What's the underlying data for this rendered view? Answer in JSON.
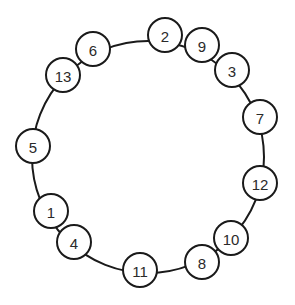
{
  "diagram": {
    "type": "ring-of-numbered-nodes",
    "ring": {
      "cx": 148,
      "cy": 157,
      "r": 116
    },
    "node_radius": 17,
    "nodes": [
      {
        "label": "2",
        "x": 165,
        "y": 35
      },
      {
        "label": "9",
        "x": 202,
        "y": 45
      },
      {
        "label": "3",
        "x": 232,
        "y": 70
      },
      {
        "label": "7",
        "x": 260,
        "y": 117
      },
      {
        "label": "12",
        "x": 260,
        "y": 183
      },
      {
        "label": "10",
        "x": 231,
        "y": 238
      },
      {
        "label": "8",
        "x": 202,
        "y": 262
      },
      {
        "label": "11",
        "x": 140,
        "y": 270
      },
      {
        "label": "4",
        "x": 74,
        "y": 242
      },
      {
        "label": "1",
        "x": 51,
        "y": 211
      },
      {
        "label": "5",
        "x": 33,
        "y": 146
      },
      {
        "label": "13",
        "x": 63,
        "y": 75
      },
      {
        "label": "6",
        "x": 93,
        "y": 49
      }
    ],
    "colors": {
      "stroke": "#1a1a1a",
      "fill": "#ffffff",
      "text": "#2a2a2a",
      "background": "#ffffff"
    }
  }
}
